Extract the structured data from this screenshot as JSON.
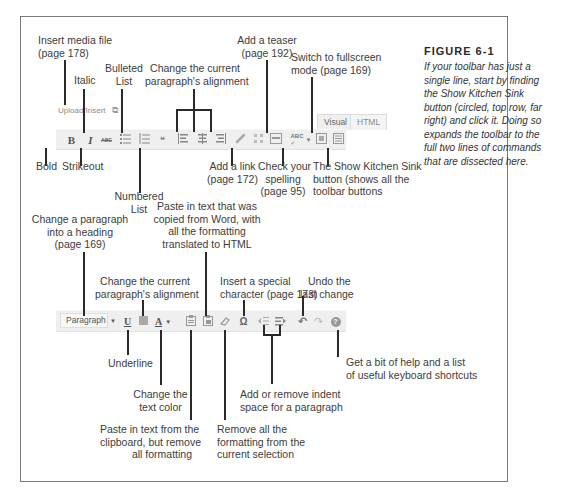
{
  "figure": {
    "title": "FIGURE 6-1",
    "caption": "If your toolbar has just a single line, start by finding the Show Kitchen Sink button (circled, top row, far right) and click it. Doing so expands the toolbar to the full two lines of commands that are dissected here."
  },
  "top_toolbar": {
    "upload_label": "Upload/Insert",
    "tabs": [
      {
        "label": "Visual",
        "active": true
      },
      {
        "label": "HTML",
        "active": false
      }
    ],
    "buttons": [
      {
        "name": "bold",
        "glyph": "B"
      },
      {
        "name": "italic",
        "glyph": "I"
      },
      {
        "name": "strikethrough",
        "glyph": "ABC"
      },
      {
        "name": "bulleted-list",
        "glyph": "☰"
      },
      {
        "name": "numbered-list",
        "glyph": "☰"
      },
      {
        "name": "blockquote",
        "glyph": "66"
      },
      {
        "name": "align-left",
        "glyph": "≡"
      },
      {
        "name": "align-center",
        "glyph": "≡"
      },
      {
        "name": "align-right",
        "glyph": "≡"
      },
      {
        "name": "insert-link",
        "glyph": "⛓"
      },
      {
        "name": "remove-link",
        "glyph": "⛓"
      },
      {
        "name": "insert-more",
        "glyph": "▭"
      },
      {
        "name": "spellcheck",
        "glyph": "ABC✓"
      },
      {
        "name": "fullscreen",
        "glyph": "⛶"
      },
      {
        "name": "kitchen-sink",
        "glyph": "▦"
      }
    ]
  },
  "bottom_toolbar": {
    "format_select": "Paragraph",
    "buttons": [
      {
        "name": "underline",
        "glyph": "U"
      },
      {
        "name": "justify",
        "glyph": "▤"
      },
      {
        "name": "text-color",
        "glyph": "A"
      },
      {
        "name": "paste-plain-text",
        "glyph": "📋"
      },
      {
        "name": "paste-from-word",
        "glyph": "📋"
      },
      {
        "name": "remove-formatting",
        "glyph": "⌫"
      },
      {
        "name": "special-character",
        "glyph": "Ω"
      },
      {
        "name": "outdent",
        "glyph": "⇤"
      },
      {
        "name": "indent",
        "glyph": "⇥"
      },
      {
        "name": "undo",
        "glyph": "↶"
      },
      {
        "name": "redo",
        "glyph": "↷"
      },
      {
        "name": "help",
        "glyph": "?"
      }
    ]
  },
  "callouts_top": {
    "insert_media": [
      "Insert media file",
      "(page 178)"
    ],
    "italic": "Italic",
    "bulleted_list": [
      "Bulleted",
      "List"
    ],
    "alignment": [
      "Change the current",
      "paragraph's alignment"
    ],
    "teaser": [
      "Add a teaser",
      "(page 192)"
    ],
    "fullscreen": [
      "Switch to fullscreen",
      "mode (page 169)"
    ],
    "bold": "Bold",
    "strikeout": "Strikeout",
    "numbered_list": [
      "Numbered",
      "List"
    ],
    "add_link": [
      "Add a link",
      "(page 172)"
    ],
    "spelling": [
      "Check your",
      "spelling",
      "(page 95)"
    ],
    "kitchen_sink": [
      "The Show Kitchen Sink",
      "button (shows all the",
      "toolbar buttons"
    ]
  },
  "callouts_bottom": {
    "heading": [
      "Change a paragraph",
      "into a heading",
      "(page 169)"
    ],
    "alignment": [
      "Change the current",
      "paragraph's alignment"
    ],
    "paste_word": [
      "Paste in text that was",
      "copied from Word, with",
      "all the formatting",
      "translated to HTML"
    ],
    "special_char": [
      "Insert a special",
      "character (page 173)"
    ],
    "undo": [
      "Undo the",
      "last change"
    ],
    "underline": "Underline",
    "help": [
      "Get a bit of help and a list",
      "of useful keyboard shortcuts"
    ],
    "text_color": [
      "Change the",
      "text color"
    ],
    "indent": [
      "Add or remove indent",
      "space for a paragraph"
    ],
    "paste_plain": [
      "Paste in text from the",
      "clipboard, but remove",
      "all formatting"
    ],
    "remove_format": [
      "Remove all the",
      "formatting from the",
      "current selection"
    ]
  }
}
